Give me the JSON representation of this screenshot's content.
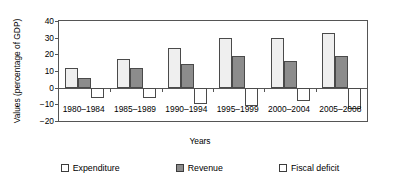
{
  "chart_data": {
    "type": "bar",
    "title": "",
    "xlabel": "Years",
    "ylabel": "Values (percentage of GDP)",
    "categories": [
      "1980–1984",
      "1985–1989",
      "1990–1994",
      "1995–1999",
      "2000–2004",
      "2005–2008"
    ],
    "series": [
      {
        "name": "Expenditure",
        "color": "#efefef",
        "values": [
          12,
          17,
          24,
          30,
          30,
          33
        ]
      },
      {
        "name": "Revenue",
        "color": "#8c8c8c",
        "values": [
          6,
          12,
          14,
          19,
          16,
          19
        ]
      },
      {
        "name": "Fiscal deficit",
        "color": "#ffffff",
        "values": [
          -6,
          -6,
          -10,
          -11,
          -8,
          -13
        ]
      }
    ],
    "ylim": [
      -20,
      40
    ],
    "yticks": [
      40,
      30,
      20,
      10,
      0,
      -10,
      -20
    ],
    "ytick_labels": [
      "40",
      "30",
      "20",
      "10",
      "0",
      "−10",
      "−20"
    ],
    "grid": false,
    "legend_position": "bottom"
  },
  "legend": {
    "items": [
      {
        "label": "Expenditure",
        "swatch": "expenditure-swatch"
      },
      {
        "label": "Revenue",
        "swatch": "revenue-swatch"
      },
      {
        "label": "Fiscal deficit",
        "swatch": "fiscal-deficit-swatch"
      }
    ]
  }
}
